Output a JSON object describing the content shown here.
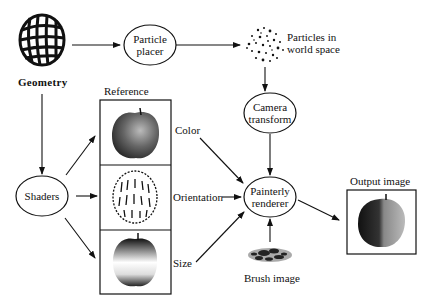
{
  "diagram": {
    "nodes": {
      "geometry": {
        "label": "Geometry"
      },
      "particle_placer": {
        "line1": "Particle",
        "line2": "placer"
      },
      "particles_world": {
        "line1": "Particles in",
        "line2": "world space"
      },
      "camera_transform": {
        "line1": "Camera",
        "line2": "transform"
      },
      "shaders": {
        "label": "Shaders"
      },
      "reference": {
        "label": "Reference"
      },
      "painterly_renderer": {
        "line1": "Painterly",
        "line2": "renderer"
      },
      "brush_image": {
        "label": "Brush image"
      },
      "output_image": {
        "label": "Output image"
      }
    },
    "reference_channels": [
      {
        "label": "Color"
      },
      {
        "label": "Orientation"
      },
      {
        "label": "Size"
      }
    ],
    "edges": [
      {
        "from": "Geometry",
        "to": "Particle placer"
      },
      {
        "from": "Particle placer",
        "to": "Particles in world space"
      },
      {
        "from": "Particles in world space",
        "to": "Camera transform"
      },
      {
        "from": "Camera transform",
        "to": "Painterly renderer"
      },
      {
        "from": "Geometry",
        "to": "Shaders"
      },
      {
        "from": "Shaders",
        "to": "Reference Color"
      },
      {
        "from": "Shaders",
        "to": "Reference Orientation"
      },
      {
        "from": "Shaders",
        "to": "Reference Size"
      },
      {
        "from": "Color",
        "to": "Painterly renderer"
      },
      {
        "from": "Orientation",
        "to": "Painterly renderer"
      },
      {
        "from": "Size",
        "to": "Painterly renderer"
      },
      {
        "from": "Brush image",
        "to": "Painterly renderer"
      },
      {
        "from": "Painterly renderer",
        "to": "Output image"
      }
    ],
    "colors": {
      "ink": "#111111",
      "background": "#ffffff"
    }
  }
}
